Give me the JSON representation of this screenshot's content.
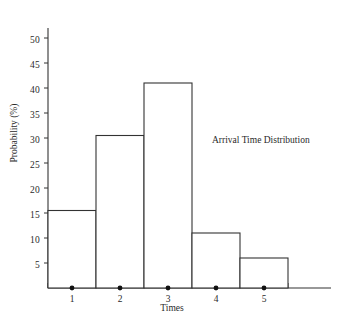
{
  "chart_data": {
    "type": "bar",
    "title": "",
    "annotation": "Arrival Time Distribution",
    "xlabel": "Times",
    "ylabel": "Probability (%)",
    "categories": [
      "1",
      "2",
      "3",
      "4",
      "5"
    ],
    "values": [
      15.5,
      30.5,
      41,
      11,
      6
    ],
    "ylim": [
      0,
      52
    ],
    "yticks": [
      5,
      10,
      15,
      20,
      25,
      30,
      35,
      40,
      45,
      50
    ],
    "ytick_labels": [
      "5",
      "10",
      "15",
      "20",
      "25",
      "30",
      "35",
      "40",
      "45",
      "50"
    ],
    "xtick_labels": [
      "1",
      "2",
      "3",
      "4",
      "5"
    ],
    "grid": false,
    "legend": "none",
    "bar_style": "outline",
    "bar_fill": "#ffffff",
    "bar_stroke": "#333333",
    "axis_color": "#333333",
    "marker_style": "dot",
    "marker_color": "#111111"
  },
  "axes": {
    "y_tick_labels": [
      {
        "value": 50,
        "text": "50"
      },
      {
        "value": 45,
        "text": "45"
      },
      {
        "value": 40,
        "text": "40"
      },
      {
        "value": 35,
        "text": "35"
      },
      {
        "value": 30,
        "text": "30"
      },
      {
        "value": 25,
        "text": "25"
      },
      {
        "value": 20,
        "text": "20"
      },
      {
        "value": 15,
        "text": "15"
      },
      {
        "value": 10,
        "text": "10"
      },
      {
        "value": 5,
        "text": "5"
      }
    ],
    "x_tick_labels": [
      {
        "text": "1"
      },
      {
        "text": "2"
      },
      {
        "text": "3"
      },
      {
        "text": "4"
      },
      {
        "text": "5"
      }
    ]
  }
}
